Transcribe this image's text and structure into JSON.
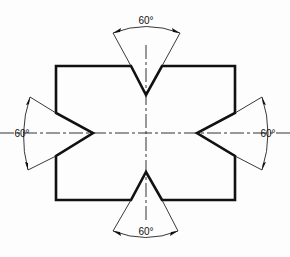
{
  "diagram": {
    "title": "",
    "shape": "rectangular plate with four 60° V-notches",
    "colors": {
      "stroke": "#111111",
      "background": "#fdfdfd"
    },
    "angles": {
      "top": "60°",
      "left": "60°",
      "right": "60°",
      "bottom": "60°"
    }
  }
}
